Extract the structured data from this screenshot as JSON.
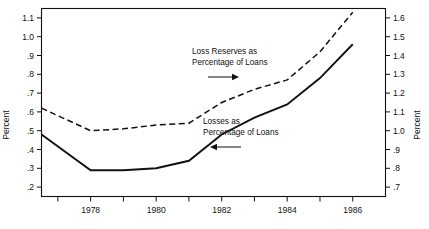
{
  "chart_data": {
    "type": "line",
    "title": "",
    "xlabel": "",
    "ylabel": "Percent",
    "y2label": "Percent",
    "xlim": [
      1976.5,
      1987.0
    ],
    "ylim": [
      0.15,
      1.15
    ],
    "y2lim": [
      0.65,
      1.65
    ],
    "grid": false,
    "legend_position": "inline-annotations",
    "x_tick_values": [
      1977,
      1978,
      1979,
      1980,
      1981,
      1982,
      1983,
      1984,
      1985,
      1986
    ],
    "x_tick_labels": [
      "",
      "1978",
      "",
      "1980",
      "",
      "1982",
      "",
      "1984",
      "",
      "1986"
    ],
    "x_labeled_ticks": [
      "1978",
      "1980",
      "1982",
      "1984",
      "1986"
    ],
    "y_left_ticks": [
      0.2,
      0.3,
      0.4,
      0.5,
      0.6,
      0.7,
      0.8,
      0.9,
      1.0,
      1.1
    ],
    "y_left_tick_labels": [
      ".2",
      ".3",
      ".4",
      ".5",
      ".6",
      ".7",
      ".8",
      ".9",
      "1.0",
      "1.1"
    ],
    "y_right_ticks": [
      0.7,
      0.8,
      0.9,
      1.0,
      1.1,
      1.2,
      1.3,
      1.4,
      1.5,
      1.6
    ],
    "y_right_tick_labels": [
      ".7",
      ".8",
      ".9",
      "1.0",
      "1.1",
      "1.2",
      "1.3",
      "1.4",
      "1.5",
      "1.6"
    ],
    "series": [
      {
        "name": "Losses as Percentage of Loans",
        "style": "solid",
        "axis": "left",
        "x": [
          1976.5,
          1978,
          1979,
          1980,
          1981,
          1982,
          1983,
          1984,
          1985,
          1986
        ],
        "values": [
          0.48,
          0.29,
          0.29,
          0.3,
          0.34,
          0.48,
          0.57,
          0.64,
          0.78,
          0.96
        ]
      },
      {
        "name": "Loss Reserves as Percentage of Loans",
        "style": "dashed",
        "axis": "right",
        "x": [
          1976.5,
          1978,
          1979,
          1980,
          1981,
          1982,
          1983,
          1984,
          1985,
          1986
        ],
        "values": [
          1.12,
          1.0,
          1.01,
          1.03,
          1.04,
          1.15,
          1.22,
          1.27,
          1.42,
          1.63
        ]
      }
    ],
    "annotations": [
      {
        "id": "reserves-annotation",
        "lines": [
          "Loss Reserves as",
          "Percentage of Loans"
        ],
        "arrow_direction": "right"
      },
      {
        "id": "losses-annotation",
        "lines": [
          "Losses as",
          "Percentage of Loans"
        ],
        "arrow_direction": "left"
      }
    ],
    "colors": {
      "line": "#111111",
      "background": "#ffffff",
      "axis": "#111111"
    }
  }
}
